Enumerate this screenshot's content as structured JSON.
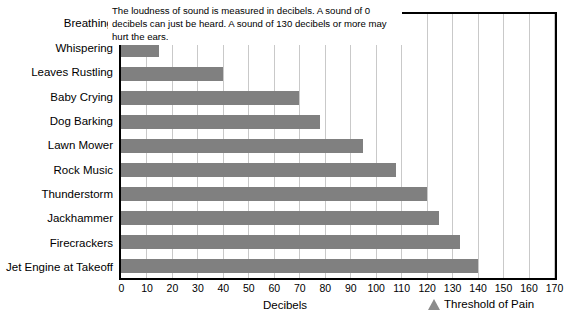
{
  "chart_data": {
    "type": "bar",
    "orientation": "horizontal",
    "title": "Noise Levels of Common Sounds",
    "xlabel": "Decibels",
    "ylabel": "",
    "xlim": [
      0,
      170
    ],
    "xticks": [
      0,
      10,
      20,
      30,
      40,
      50,
      60,
      70,
      80,
      90,
      100,
      110,
      120,
      130,
      140,
      150,
      160,
      170
    ],
    "grid": true,
    "grid_axis": "x",
    "legend_position": "bottom-right",
    "bar_color": "#808080",
    "categories": [
      "Breathing",
      "Whispering",
      "Leaves Rustling",
      "Baby Crying",
      "Dog Barking",
      "Lawn Mower",
      "Rock Music",
      "Thunderstorm",
      "Jackhammer",
      "Firecrackers",
      "Jet Engine at Takeoff"
    ],
    "values": [
      10,
      15,
      40,
      70,
      78,
      95,
      108,
      120,
      125,
      133,
      140
    ],
    "series": [
      {
        "name": "Decibels",
        "values": [
          10,
          15,
          40,
          70,
          78,
          95,
          108,
          120,
          125,
          133,
          140
        ]
      }
    ],
    "annotations": [
      {
        "name": "decibel-explanation",
        "text": "The loudness of sound is measured in decibels. A sound of 0 decibels can just be heard. A sound of 130 decibels or more may hurt the ears."
      }
    ],
    "legend": [
      {
        "label": "Threshold of Pain",
        "marker": "triangle",
        "color": "#8c8c8c"
      }
    ]
  },
  "icons": {
    "legend_marker": "triangle-up-icon"
  }
}
